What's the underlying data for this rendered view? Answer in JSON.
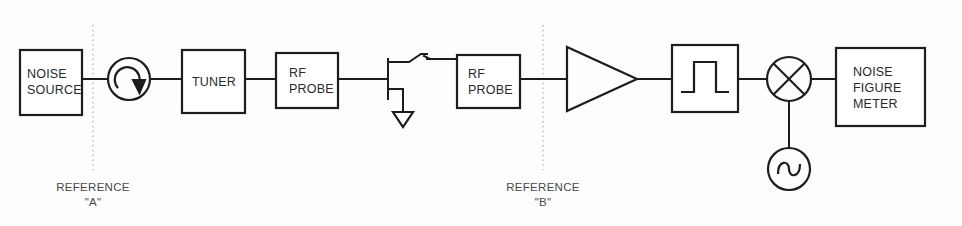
{
  "diagram": {
    "stroke_color": "#1d1d1d",
    "background_color": "#fdfdfd",
    "reference_line_color": "#b9b9b9",
    "blocks": [
      {
        "id": "noise-source",
        "label_line1": "NOISE",
        "label_line2": "SOURCE",
        "shape": "rect"
      },
      {
        "id": "isolator",
        "label": "",
        "shape": "circle-with-curved-arrow"
      },
      {
        "id": "tuner",
        "label_line1": "TUNER",
        "label_line2": "",
        "shape": "rect"
      },
      {
        "id": "rf-probe-1",
        "label_line1": "RF",
        "label_line2": "PROBE",
        "shape": "rect"
      },
      {
        "id": "transistor-dut",
        "label": "",
        "shape": "fet-transistor-with-ground"
      },
      {
        "id": "rf-probe-2",
        "label_line1": "RF",
        "label_line2": "PROBE",
        "shape": "rect"
      },
      {
        "id": "amplifier",
        "label": "",
        "shape": "triangle"
      },
      {
        "id": "bandpass-filter",
        "label": "",
        "shape": "rect-with-pulse"
      },
      {
        "id": "mixer",
        "label": "",
        "shape": "circle-with-x"
      },
      {
        "id": "local-oscillator",
        "label": "",
        "shape": "circle-with-sine"
      },
      {
        "id": "noise-figure-meter",
        "label_line1": "NOISE",
        "label_line2": "FIGURE",
        "label_line3": "METER",
        "shape": "rect"
      }
    ],
    "references": [
      {
        "id": "reference-a",
        "line1": "REFERENCE",
        "line2": "\"A\""
      },
      {
        "id": "reference-b",
        "line1": "REFERENCE",
        "line2": "\"B\""
      }
    ]
  }
}
